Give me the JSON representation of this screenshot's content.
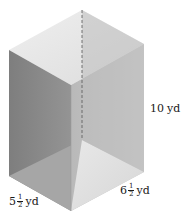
{
  "figure": {
    "type": "open rectangular prism (box) with dashed hidden edge",
    "colors": {
      "background": "#ffffff",
      "top_face": "#e6e6e6",
      "left_outer_face": "#8a8a8a",
      "back_right_inner_face": "#b4b4b4",
      "front_right_face": "#c2c2c2",
      "floor_left": "#a8a8a8",
      "floor_right": "#dedede",
      "dashed_edge": "#555555"
    },
    "vertices": {
      "top_back": [
        82,
        10
      ],
      "top_left": [
        9,
        50
      ],
      "top_front": [
        71,
        85
      ],
      "top_right": [
        144,
        44
      ],
      "bottom_back": [
        82,
        140
      ],
      "bottom_left": [
        9,
        176
      ],
      "bottom_front": [
        71,
        211
      ],
      "bottom_right": [
        144,
        172
      ]
    }
  },
  "labels": {
    "height": {
      "whole": "10",
      "unit": "yd"
    },
    "depth": {
      "whole": "5",
      "num": "1",
      "den": "2",
      "unit": "yd"
    },
    "width": {
      "whole": "6",
      "num": "1",
      "den": "2",
      "unit": "yd"
    }
  }
}
